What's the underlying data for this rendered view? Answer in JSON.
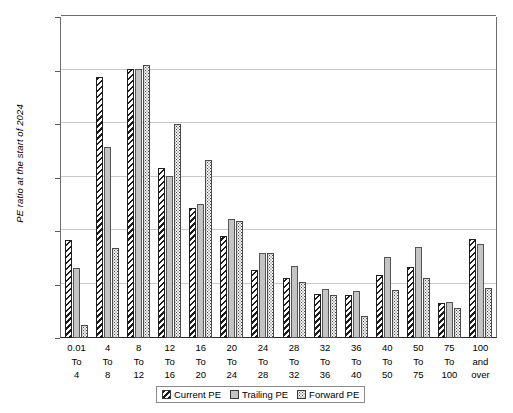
{
  "chart_data": {
    "type": "bar",
    "title": "",
    "xlabel": "",
    "ylabel": "PE ratio at the start of 2024",
    "ylim": [
      0,
      600
    ],
    "yticks": [
      0,
      100,
      200,
      300,
      400,
      500,
      600
    ],
    "grid": true,
    "legend_position": "bottom",
    "categories": [
      "0.01 To 4",
      "4 To 8",
      "8 To 12",
      "12 To 16",
      "16 To 20",
      "20 To 24",
      "24 To 28",
      "28 To 32",
      "32 To 36",
      "36 To 40",
      "40 To 50",
      "50 To 75",
      "75 To 100",
      "100 and over"
    ],
    "category_lines": [
      [
        "0.01",
        "To",
        "4"
      ],
      [
        "4",
        "To",
        "8"
      ],
      [
        "8",
        "To",
        "12"
      ],
      [
        "12",
        "To",
        "16"
      ],
      [
        "16",
        "To",
        "20"
      ],
      [
        "20",
        "To",
        "24"
      ],
      [
        "24",
        "To",
        "28"
      ],
      [
        "28",
        "To",
        "32"
      ],
      [
        "32",
        "To",
        "36"
      ],
      [
        "36",
        "To",
        "40"
      ],
      [
        "40",
        "To",
        "50"
      ],
      [
        "50",
        "To",
        "75"
      ],
      [
        "75",
        "To",
        "100"
      ],
      [
        "100",
        "and",
        "over"
      ]
    ],
    "series": [
      {
        "name": "Current PE",
        "pattern": "diagonal-hatch",
        "values": [
          183,
          487,
          502,
          317,
          243,
          190,
          127,
          113,
          83,
          80,
          118,
          133,
          65,
          185
        ]
      },
      {
        "name": "Trailing PE",
        "pattern": "solid-gray",
        "values": [
          130,
          357,
          502,
          303,
          250,
          222,
          158,
          135,
          92,
          88,
          152,
          170,
          68,
          175
        ]
      },
      {
        "name": "Forward PE",
        "pattern": "dotted",
        "values": [
          25,
          168,
          510,
          400,
          333,
          218,
          158,
          105,
          80,
          42,
          90,
          112,
          57,
          93
        ]
      }
    ]
  },
  "legend": {
    "items": [
      {
        "label": "Current PE"
      },
      {
        "label": "Trailing PE"
      },
      {
        "label": "Forward PE"
      }
    ]
  },
  "colors": {
    "grid": "#c9c9c9",
    "axis": "#2a2a2a",
    "current": "#1c1c1c",
    "trailing": "#c4c4c4",
    "forward": "#f2f2f2"
  }
}
